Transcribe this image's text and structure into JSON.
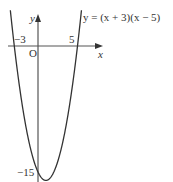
{
  "chart_data": {
    "type": "line",
    "title": "",
    "equation_label": "y = (x + 3)(x − 5)",
    "function": "(x + 3)(x - 5)",
    "xlabel": "x",
    "ylabel": "y",
    "origin_label": "O",
    "annotations": [
      {
        "text": "−3",
        "x": -3,
        "y": 0,
        "meaning": "x-intercept"
      },
      {
        "text": "5",
        "x": 5,
        "y": 0,
        "meaning": "x-intercept"
      },
      {
        "text": "−15",
        "x": 0,
        "y": -15,
        "meaning": "y-intercept"
      }
    ],
    "x": [
      -3.6,
      -3,
      -2,
      -1,
      0,
      1,
      2,
      3,
      4,
      5,
      5.6
    ],
    "values": [
      5.16,
      0,
      -7,
      -12,
      -15,
      -16,
      -15,
      -12,
      -7,
      0,
      5.16
    ],
    "xlim": [
      -3.8,
      8
    ],
    "ylim": [
      -16,
      4
    ],
    "grid": false,
    "legend": "none"
  },
  "labels": {
    "equation": "y = (x + 3)(x − 5)",
    "x_axis": "x",
    "y_axis": "y",
    "origin": "O",
    "x_intercept_left": "−3",
    "x_intercept_right": "5",
    "y_intercept": "−15"
  }
}
